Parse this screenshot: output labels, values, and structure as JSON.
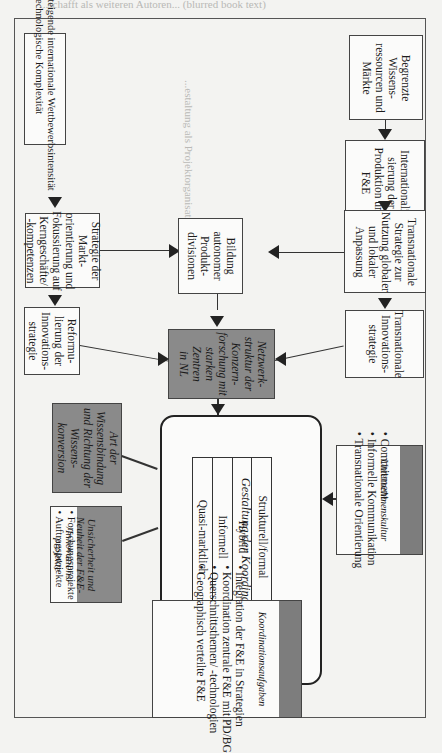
{
  "background_text": {
    "top_line": "...schafft als weiteren Autoren... (blurred book text)",
    "section_heading": "...estaltung als Projektorganisation"
  },
  "diagram": {
    "left_column": {
      "factors_box": {
        "bullets": [
          "Steigende internationale Wettbewerbsintensität",
          "Technologische Komplexität"
        ]
      },
      "strategy_box": {
        "lines": [
          "Strategie der",
          "Markt-",
          "orientierung und",
          "Fokussierung auf",
          "Kerngeschäfte/",
          "-kompetenzen"
        ]
      },
      "reform_box": {
        "lines": [
          "Reformu-",
          "lierung der",
          "Innovations-",
          "strategie"
        ]
      },
      "knowledge_box": {
        "lines": [
          "Art der",
          "Wissensbindung",
          "und Richtung der",
          "Wissens-",
          "konversion"
        ]
      },
      "uncertainty_box": {
        "header_lines": [
          "Unsicherheit und",
          "Neuheit der F&E-",
          "/Innovations-",
          "projekte"
        ],
        "bullets": [
          "Forschungsprojekte",
          "Auftragsprojekte"
        ]
      }
    },
    "center_column": {
      "product_divisions_box": {
        "lines": [
          "Bildung",
          "autonomer",
          "Produkt-",
          "divisionen"
        ]
      },
      "network_box": {
        "lines": [
          "Netzwerk-",
          "struktur der",
          "Konzern-",
          "forschung mit",
          "starken",
          "Zentren",
          "in NL"
        ]
      },
      "coordination_box": {
        "title": "Gestaltung der Koordination",
        "modes": [
          "Strukturell/formal",
          "Hybrid",
          "Informell",
          "Quasi-marktlich"
        ]
      }
    },
    "right_column": {
      "resources_box": {
        "lines": [
          "Begrenzte",
          "Wissens-",
          "ressourcen und",
          "Märkte"
        ]
      },
      "internationalization_box": {
        "lines": [
          "Internationali-",
          "sierung der",
          "Produktion und",
          "F&E"
        ]
      },
      "transnational_strategy_box": {
        "lines": [
          "Transnationale",
          "Strategie zur",
          "Nutzung globaler",
          "und lokaler",
          "Anpassung"
        ]
      },
      "transnational_innovation_box": {
        "lines": [
          "Transnationale",
          "Innovations-",
          "strategie"
        ]
      },
      "culture_box": {
        "header": "Unternehmenskultur",
        "bullets": [
          "Commitment",
          "Informelle Kommunikation",
          "Transnationale Orientierung"
        ]
      }
    },
    "bottom": {
      "tasks_box": {
        "header": "Koordinationsaufgaben",
        "bullets": [
          "Integration der F&E in Strategien",
          "Koordination zentrale F&E mit PD/BG",
          "Querschnittsthemen/ -technologien",
          "Geographisch verteilte F&E"
        ]
      }
    }
  },
  "colors": {
    "paper": "#f3f3f1",
    "box_fill": "#fbfbfa",
    "shaded_box": "#8a8a8a",
    "line": "#333333"
  }
}
